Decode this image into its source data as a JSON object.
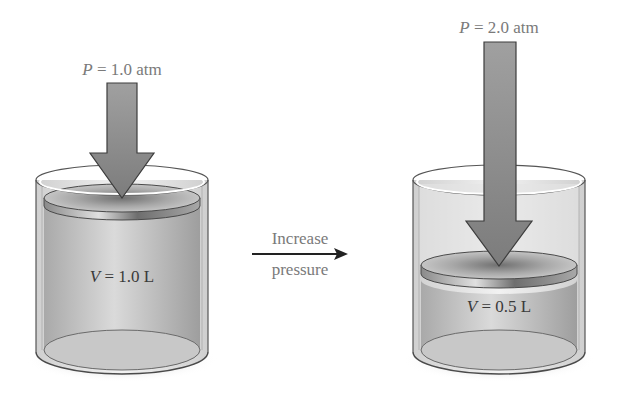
{
  "figure": {
    "left_state": {
      "pressure_var": "P",
      "pressure_eq": " = 1.0 atm",
      "volume_var": "V",
      "volume_eq": " = 1.0 L"
    },
    "transition": {
      "line1": "Increase",
      "line2": "pressure"
    },
    "right_state": {
      "pressure_var": "P",
      "pressure_eq": " = 2.0 atm",
      "volume_var": "V",
      "volume_eq": " = 0.5 L"
    },
    "colors": {
      "arrow_fill": "#8a8a8a",
      "arrow_stroke": "#3c3c3c",
      "gas_fill": "#c4c4c4",
      "glass": "#e8e8e8",
      "label_text": "#7a7a7a"
    }
  }
}
